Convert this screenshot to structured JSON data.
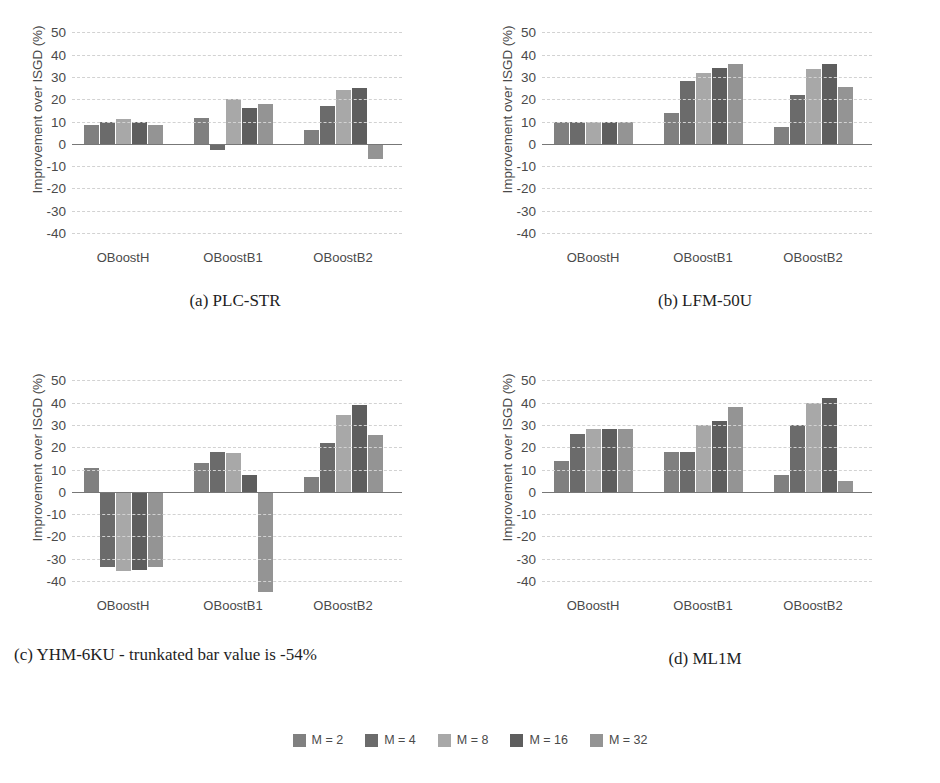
{
  "figure": {
    "ylabel": "Improvement over ISGD (%)",
    "yticks": [
      50,
      40,
      30,
      20,
      10,
      0,
      -10,
      -20,
      -30,
      -40
    ],
    "ylim": [
      -45,
      52
    ],
    "categories": [
      "OBoostH",
      "OBoostB1",
      "OBoostB2"
    ],
    "series_names": [
      "M = 2",
      "M = 4",
      "M = 8",
      "M = 16",
      "M = 32"
    ],
    "colors": [
      "#808080",
      "#6b6b6b",
      "#a8a8a8",
      "#5e5e5e",
      "#949494"
    ],
    "grid": true,
    "legend_position": "bottom-center"
  },
  "legend": {
    "items": [
      {
        "label": "M = 2",
        "color": "#808080"
      },
      {
        "label": "M = 4",
        "color": "#6b6b6b"
      },
      {
        "label": "M = 8",
        "color": "#a8a8a8"
      },
      {
        "label": "M = 16",
        "color": "#5e5e5e"
      },
      {
        "label": "M = 32",
        "color": "#949494"
      }
    ]
  },
  "panels": [
    {
      "key": "a",
      "caption": "(a) PLC-STR",
      "ylabel": "Improvement over ISGD (%)"
    },
    {
      "key": "b",
      "caption": "(b) LFM-50U",
      "ylabel": "Improvement over ISGD (%)"
    },
    {
      "key": "c",
      "caption": "(c) YHM-6KU - trunkated bar value is -54%",
      "ylabel": "Improvement over ISGD (%)"
    },
    {
      "key": "d",
      "caption": "(d) ML1M",
      "ylabel": "Improvement over ISGD (%)"
    }
  ],
  "chart_data": [
    {
      "type": "bar",
      "title": "(a) PLC-STR",
      "xlabel": "",
      "ylabel": "Improvement over ISGD (%)",
      "ylim": [
        -45,
        52
      ],
      "yticks": [
        50,
        40,
        30,
        20,
        10,
        0,
        -10,
        -20,
        -30,
        -40
      ],
      "grid": true,
      "categories": [
        "OBoostH",
        "OBoostB1",
        "OBoostB2"
      ],
      "series": [
        {
          "name": "M = 2",
          "values": [
            8.5,
            11.5,
            6
          ]
        },
        {
          "name": "M = 4",
          "values": [
            10,
            -3,
            17
          ]
        },
        {
          "name": "M = 8",
          "values": [
            11,
            20,
            24
          ]
        },
        {
          "name": "M = 16",
          "values": [
            10,
            16,
            25
          ]
        },
        {
          "name": "M = 32",
          "values": [
            8.5,
            18,
            -7
          ]
        }
      ]
    },
    {
      "type": "bar",
      "title": "(b) LFM-50U",
      "xlabel": "",
      "ylabel": "Improvement over ISGD (%)",
      "ylim": [
        -45,
        52
      ],
      "yticks": [
        50,
        40,
        30,
        20,
        10,
        0,
        -10,
        -20,
        -30,
        -40
      ],
      "grid": true,
      "categories": [
        "OBoostH",
        "OBoostB1",
        "OBoostB2"
      ],
      "series": [
        {
          "name": "M = 2",
          "values": [
            10,
            14,
            7.5
          ]
        },
        {
          "name": "M = 4",
          "values": [
            10,
            28,
            22
          ]
        },
        {
          "name": "M = 8",
          "values": [
            10,
            32,
            33.5
          ]
        },
        {
          "name": "M = 16",
          "values": [
            10,
            34,
            36
          ]
        },
        {
          "name": "M = 32",
          "values": [
            10,
            36,
            25.5
          ]
        }
      ]
    },
    {
      "type": "bar",
      "title": "(c) YHM-6KU - trunkated bar value is -54%",
      "xlabel": "",
      "ylabel": "Improvement over ISGD (%)",
      "ylim": [
        -45,
        52
      ],
      "yticks": [
        50,
        40,
        30,
        20,
        10,
        0,
        -10,
        -20,
        -30,
        -40
      ],
      "grid": true,
      "categories": [
        "OBoostH",
        "OBoostB1",
        "OBoostB2"
      ],
      "annotations": [
        "trunkated bar value is -54%"
      ],
      "series": [
        {
          "name": "M = 2",
          "values": [
            10.5,
            13,
            6.5
          ]
        },
        {
          "name": "M = 4",
          "values": [
            -34,
            18,
            22
          ]
        },
        {
          "name": "M = 8",
          "values": [
            -35.5,
            17.5,
            34.5
          ]
        },
        {
          "name": "M = 16",
          "values": [
            -35,
            7.5,
            39
          ]
        },
        {
          "name": "M = 32",
          "values": [
            -34,
            -54,
            25.5
          ]
        }
      ]
    },
    {
      "type": "bar",
      "title": "(d) ML1M",
      "xlabel": "",
      "ylabel": "Improvement over ISGD (%)",
      "ylim": [
        -45,
        52
      ],
      "yticks": [
        50,
        40,
        30,
        20,
        10,
        0,
        -10,
        -20,
        -30,
        -40
      ],
      "grid": true,
      "categories": [
        "OBoostH",
        "OBoostB1",
        "OBoostB2"
      ],
      "series": [
        {
          "name": "M = 2",
          "values": [
            14,
            18,
            7.5
          ]
        },
        {
          "name": "M = 4",
          "values": [
            26,
            18,
            30
          ]
        },
        {
          "name": "M = 8",
          "values": [
            28,
            30,
            40
          ]
        },
        {
          "name": "M = 16",
          "values": [
            28,
            32,
            42
          ]
        },
        {
          "name": "M = 32",
          "values": [
            28,
            38,
            5
          ]
        }
      ]
    }
  ]
}
